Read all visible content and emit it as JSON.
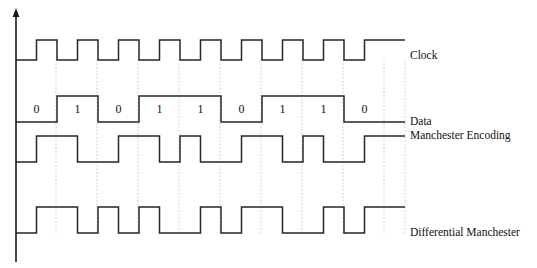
{
  "figure": {
    "kind": "timing-diagram",
    "background_color": "#ffffff",
    "line_color": "#262626",
    "axis_color": "#1a1a1a",
    "gridline_color": "#bdbdbd",
    "text_color": "#111111"
  },
  "axis": {
    "name": "vertical-axis",
    "x": 16,
    "top_y": 8,
    "bottom_y": 262,
    "arrow_head": "up"
  },
  "timing": {
    "plot_left_x": 16,
    "plot_right_x": 405,
    "bit_start_x": 16,
    "bit_width": 41,
    "bit_count": 9,
    "gridlines_x": [
      56,
      97,
      138,
      179,
      220,
      261,
      302,
      343,
      384,
      405
    ]
  },
  "data_bits": [
    "0",
    "1",
    "0",
    "1",
    "1",
    "0",
    "1",
    "1",
    "0"
  ],
  "signals": [
    {
      "id": "clock",
      "label": "Clock",
      "label_x": 410,
      "label_y": 56,
      "high_y": 40,
      "low_y": 60,
      "start_level": "low",
      "description": "Square clock, one full cycle per bit, low first half then high second half"
    },
    {
      "id": "data",
      "label": "Data",
      "label_x": 410,
      "label_y": 122,
      "high_y": 96,
      "low_y": 122,
      "start_level": "low",
      "description": "NRZ-L data line holding each bit value for a full bit period"
    },
    {
      "id": "manchester",
      "label": "Manchester Encoding",
      "label_x": 410,
      "label_y": 136,
      "high_y": 136,
      "low_y": 162,
      "start_level": "low",
      "description": "Mid-bit transition: 0 is low-to-high, 1 is high-to-low"
    },
    {
      "id": "differential_manchester",
      "label": "Differential Manchester",
      "label_x": 410,
      "label_y": 233,
      "high_y": 207,
      "low_y": 233,
      "start_level": "low",
      "description": "Always a mid-bit transition; a 0 also causes a transition at the bit boundary"
    }
  ],
  "chart_data": {
    "type": "line",
    "title": "",
    "xlabel": "",
    "ylabel": "",
    "bits": [
      "0",
      "1",
      "0",
      "1",
      "1",
      "0",
      "1",
      "1",
      "0"
    ],
    "series": [
      {
        "name": "Clock",
        "note": "low in first half of each bit, high in second half",
        "levels_half_bit": [
          0,
          1,
          0,
          1,
          0,
          1,
          0,
          1,
          0,
          1,
          0,
          1,
          0,
          1,
          0,
          1,
          0,
          1
        ]
      },
      {
        "name": "Data",
        "note": "one level per whole bit period",
        "levels_per_bit": [
          0,
          1,
          0,
          1,
          1,
          0,
          1,
          1,
          0
        ]
      },
      {
        "name": "Manchester Encoding",
        "note": "per half bit; 0 = low then high, 1 = high then low",
        "levels_half_bit": [
          0,
          1,
          1,
          0,
          0,
          1,
          1,
          0,
          1,
          0,
          0,
          1,
          1,
          0,
          1,
          0,
          0,
          1
        ]
      },
      {
        "name": "Differential Manchester",
        "note": "per half bit as drawn in the figure",
        "levels_half_bit": [
          0,
          1,
          1,
          0,
          1,
          0,
          1,
          0,
          0,
          1,
          0,
          1,
          1,
          0,
          0,
          1,
          0,
          1
        ]
      }
    ],
    "legend_position": "right"
  }
}
